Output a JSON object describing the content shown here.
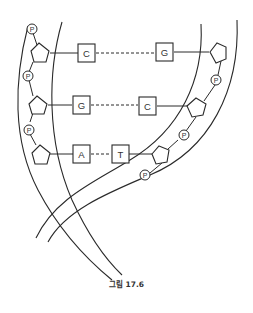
{
  "figure": {
    "caption": "그림 17.6",
    "base_pairs": [
      {
        "left": "C",
        "right": "G"
      },
      {
        "left": "G",
        "right": "C"
      },
      {
        "left": "A",
        "right": "T"
      }
    ],
    "phosphate_label": "P",
    "left_strand_phosphate_count": 4,
    "right_strand_phosphate_count": 3,
    "colors": {
      "ink": "#2a2a2a",
      "background": "#ffffff"
    }
  }
}
